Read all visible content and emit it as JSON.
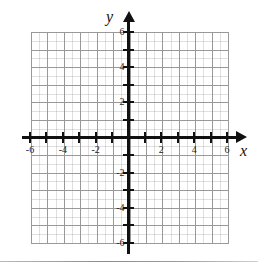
{
  "figure": {
    "kind": "cartesian-coordinate-plane",
    "axis_labels": {
      "x": "x",
      "y": "y"
    }
  },
  "chart_data": {
    "type": "scatter",
    "title": "",
    "subtitle": "",
    "xlabel": "x",
    "ylabel": "y",
    "xlim": [
      -6,
      6
    ],
    "ylim": [
      -6,
      6
    ],
    "x_ticks": [
      -6,
      -5,
      -4,
      -3,
      -2,
      -1,
      0,
      1,
      2,
      3,
      4,
      5,
      6
    ],
    "y_ticks": [
      -6,
      -5,
      -4,
      -3,
      -2,
      -1,
      0,
      1,
      2,
      3,
      4,
      5,
      6
    ],
    "x_tick_labels_shown": [
      "-6",
      "-4",
      "-2",
      "2",
      "4",
      "6"
    ],
    "y_tick_labels_shown": [
      "6",
      "4",
      "2",
      "-2",
      "-4",
      "-6"
    ],
    "grid": true,
    "grid_minor": true,
    "grid_step_major": 1,
    "grid_step_minor": 0.5,
    "legend": "none",
    "series": [],
    "x": [],
    "values": [],
    "annotations": []
  },
  "x_axis": {
    "name": "x",
    "labels": [
      {
        "value": -6,
        "text": "-6"
      },
      {
        "value": -4,
        "text": "-4"
      },
      {
        "value": -2,
        "text": "-2"
      },
      {
        "value": 2,
        "text": "2"
      },
      {
        "value": 4,
        "text": "4"
      },
      {
        "value": 6,
        "text": "6"
      }
    ],
    "ticks": [
      -6,
      -5,
      -4,
      -3,
      -2,
      -1,
      0,
      1,
      2,
      3,
      4,
      5,
      6
    ]
  },
  "y_axis": {
    "name": "y",
    "labels": [
      {
        "value": 6,
        "text": "6"
      },
      {
        "value": 4,
        "text": "4"
      },
      {
        "value": 2,
        "text": "2"
      },
      {
        "value": -2,
        "text": "-2"
      },
      {
        "value": -4,
        "text": "-4"
      },
      {
        "value": -6,
        "text": "-6"
      }
    ],
    "ticks": [
      -6,
      -5,
      -4,
      -3,
      -2,
      -1,
      0,
      1,
      2,
      3,
      4,
      5,
      6
    ]
  },
  "colors": {
    "axis": "#111111",
    "grid_major": "#9a9a9a",
    "grid_minor": "#bdbdbd",
    "label": "#222222",
    "background": "#ffffff",
    "rule": "#8c8c8c"
  },
  "icons": {
    "x_arrow": "arrow-right-icon",
    "y_arrow": "arrow-up-icon"
  }
}
